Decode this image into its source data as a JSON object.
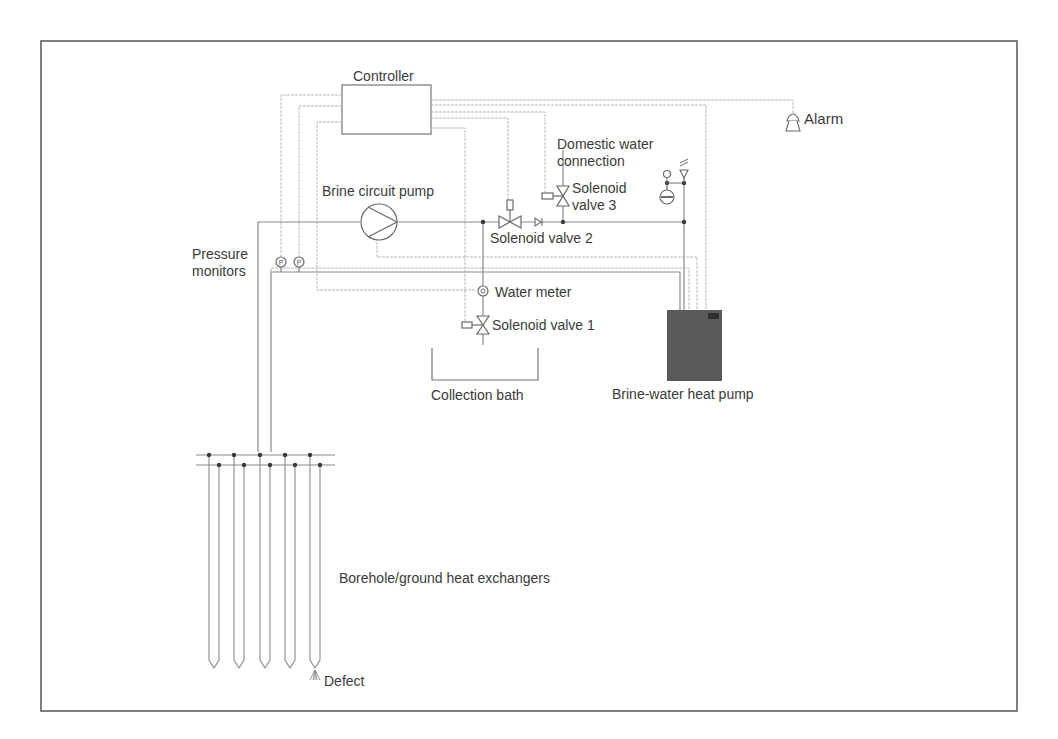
{
  "diagram": {
    "type": "process-schematic",
    "frame_color": "#555555",
    "heat_pump_color": "#5a5a5a",
    "labels": {
      "controller": "Controller",
      "alarm": "Alarm",
      "domestic_water_line1": "Domestic water",
      "domestic_water_line2": "connection",
      "solenoid_valve_3_line1": "Solenoid",
      "solenoid_valve_3_line2": "valve 3",
      "brine_circuit_pump": "Brine circuit pump",
      "solenoid_valve_2": "Solenoid valve 2",
      "pressure_monitors_line1": "Pressure",
      "pressure_monitors_line2": "monitors",
      "water_meter": "Water meter",
      "solenoid_valve_1": "Solenoid valve 1",
      "collection_bath": "Collection bath",
      "heat_pump": "Brine-water heat pump",
      "borehole": "Borehole/ground heat exchangers",
      "defect": "Defect"
    },
    "pressure_symbol": "P",
    "borehole_count": 5
  }
}
